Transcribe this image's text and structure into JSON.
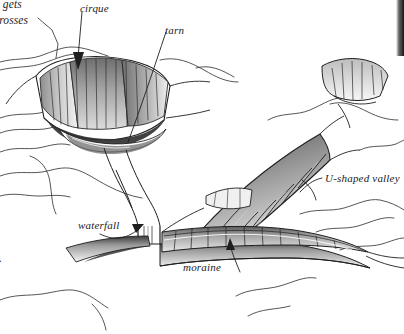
{
  "figure": {
    "kind": "pen-and-ink line drawing",
    "background_color": "#ffffff",
    "ink_color": "#1c1c1c",
    "width": 404,
    "height": 334
  },
  "labels": [
    {
      "id": "cirque",
      "text": "cirque",
      "x": 80,
      "y": 2,
      "leader": "straight line with solid arrowhead pointing down-left into the corrie hollow"
    },
    {
      "id": "tarn",
      "text": "tarn",
      "x": 165,
      "y": 24,
      "leader": "long straight line running down-left to the dark lake at the cirque floor"
    },
    {
      "id": "u-shaped-valley",
      "text": "U-shaped valley",
      "x": 325,
      "y": 172,
      "leader": "curved line sweeping left and down toward the broad valley trough"
    },
    {
      "id": "waterfall",
      "text": "waterfall",
      "x": 78,
      "y": 219,
      "leader": "curved arrow pointing up-right to the vertical fall at the hanging valley lip"
    },
    {
      "id": "moraine",
      "text": "moraine",
      "x": 183,
      "y": 261,
      "leader": "straight arrow pointing up to the banded debris ridge on the valley floor"
    }
  ],
  "body_text_fragments": [
    {
      "id": "frag-line-1",
      "text": "n gets",
      "x": 0,
      "y": -2
    },
    {
      "id": "frag-line-2",
      "text": "crosses",
      "x": 0,
      "y": 14
    },
    {
      "id": "frag-line-3",
      "text": "a",
      "x": 0,
      "y": 31
    },
    {
      "id": "frag-line-4",
      "text": ".",
      "x": 0,
      "y": 252
    }
  ],
  "scene_elements": [
    {
      "id": "cirque-hollow",
      "description": "armchair-shaped hollow, steep shaded back wall with vertical hatching"
    },
    {
      "id": "tarn-lake",
      "description": "dark elongated lake pooled in the base of the cirque"
    },
    {
      "id": "hanging-valley-lip",
      "description": "rock step where the tributary valley meets the main trough"
    },
    {
      "id": "waterfall-fall",
      "description": "narrow vertical water drop over the rock step"
    },
    {
      "id": "arete-ridge",
      "description": "striated knife-edged ridge running diagonally on the right"
    },
    {
      "id": "moraine-ridge",
      "description": "long banded ridge of deposited debris along the valley floor"
    },
    {
      "id": "u-shaped-trough",
      "description": "broad flat-floored glacial valley opening to the right"
    },
    {
      "id": "ridge-contours",
      "description": "network of thin contour-like ridge lines across the uplands"
    },
    {
      "id": "clipped-figure-edge",
      "description": "dark vertical strip of an adjacent figure clipped at the top right"
    }
  ]
}
